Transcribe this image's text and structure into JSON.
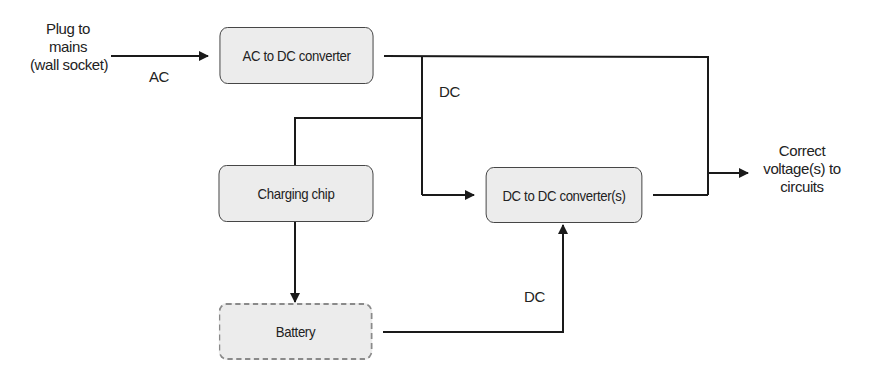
{
  "diagram": {
    "type": "block-diagram",
    "title": "",
    "nodes": {
      "ac_dc": {
        "label": "AC to DC converter",
        "style": "solid"
      },
      "charging_chip": {
        "label": "Charging chip",
        "style": "solid"
      },
      "dc_dc": {
        "label": "DC to DC converter(s)",
        "style": "solid"
      },
      "battery": {
        "label": "Battery",
        "style": "dashed"
      }
    },
    "labels": {
      "input_line1": "Plug to",
      "input_line2": "mains",
      "input_line3": "(wall socket)",
      "ac": "AC",
      "dc_top": "DC",
      "dc_battery": "DC",
      "output_line1": "Correct",
      "output_line2": "voltage(s) to",
      "output_line3": "circuits"
    },
    "edges": [
      {
        "from": "Plug to mains (wall socket)",
        "to": "AC to DC converter",
        "label": "AC"
      },
      {
        "from": "AC to DC converter",
        "to": "Correct voltage(s) to circuits",
        "label": "DC"
      },
      {
        "from": "AC to DC converter",
        "to": "Charging chip"
      },
      {
        "from": "AC to DC converter",
        "to": "DC to DC converter(s)"
      },
      {
        "from": "Charging chip",
        "to": "Battery"
      },
      {
        "from": "Battery",
        "to": "DC to DC converter(s)",
        "label": "DC"
      },
      {
        "from": "DC to DC converter(s)",
        "to": "Correct voltage(s) to circuits"
      }
    ],
    "colors": {
      "box_fill": "#ececec",
      "box_border": "#3a3a3a",
      "dashed_border": "#8a8a8a",
      "line": "#1a1a1a"
    }
  }
}
